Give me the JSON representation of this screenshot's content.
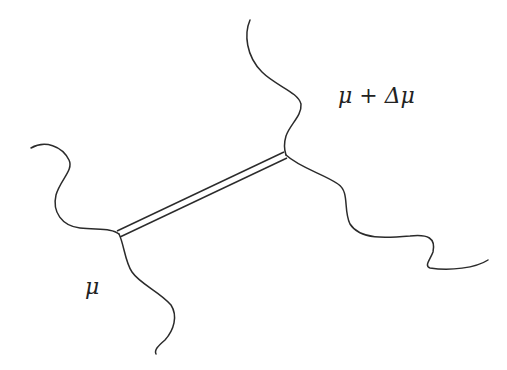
{
  "diagram": {
    "type": "string-junction",
    "labels": {
      "left_region": "μ",
      "right_region": "μ + Δμ"
    },
    "junctions": [
      {
        "name": "left-junction",
        "x": 119,
        "y": 234
      },
      {
        "name": "right-junction",
        "x": 286,
        "y": 155
      }
    ],
    "connector": {
      "style": "double-line",
      "from": "left-junction",
      "to": "right-junction"
    },
    "strands": [
      {
        "name": "left-upper-strand",
        "ends_at": "left-junction"
      },
      {
        "name": "left-lower-strand",
        "ends_at": "left-junction"
      },
      {
        "name": "right-upper-strand",
        "ends_at": "right-junction"
      },
      {
        "name": "right-lower-strand",
        "ends_at": "right-junction"
      }
    ],
    "colors": {
      "stroke": "#2b2b2b",
      "background": "#ffffff",
      "text": "#222222"
    }
  }
}
